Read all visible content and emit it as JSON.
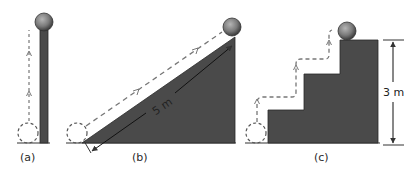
{
  "colors": {
    "solid": "#4a4a4a",
    "ball": "#7a7a7a",
    "line": "#333333",
    "dash": "#777777",
    "background": "#ffffff"
  },
  "panels": [
    {
      "id": "a",
      "label": "(a)",
      "shape": "vertical-pole"
    },
    {
      "id": "b",
      "label": "(b)",
      "shape": "inclined-ramp",
      "dimension": "5 m"
    },
    {
      "id": "c",
      "label": "(c)",
      "shape": "three-step-staircase",
      "dimension": "3 m"
    }
  ]
}
